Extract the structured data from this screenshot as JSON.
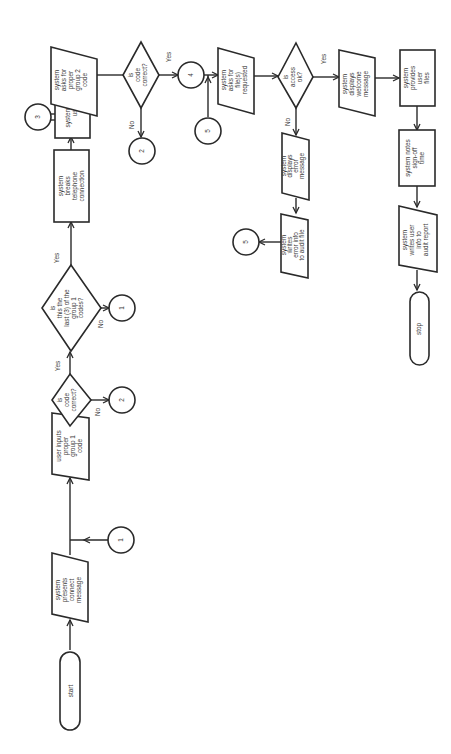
{
  "diagram": {
    "orientation": "rotated 90 degrees (text reads bottom-to-top)",
    "nodes": {
      "start": {
        "type": "terminal",
        "lines": [
          "start"
        ]
      },
      "connect_msg": {
        "type": "io",
        "lines": [
          "system",
          "presents",
          "connect",
          "message"
        ]
      },
      "conn1_a": {
        "type": "connector",
        "label": "1"
      },
      "input_g1": {
        "type": "io",
        "lines": [
          "user inputs",
          "proper",
          "group 1",
          "code"
        ]
      },
      "dec_code1": {
        "type": "decision",
        "lines": [
          "is",
          "code",
          "correct?"
        ],
        "yes": "Yes",
        "no": "No"
      },
      "conn2_a": {
        "type": "connector",
        "label": "2"
      },
      "dec_last": {
        "type": "decision",
        "lines": [
          "is",
          "this the",
          "last (3) of the",
          "group 1",
          "codes?"
        ],
        "yes": "Yes",
        "no": "No"
      },
      "conn1_b": {
        "type": "connector",
        "label": "1"
      },
      "break_conn": {
        "type": "process",
        "lines": [
          "system",
          "breaks",
          "telephone",
          "connection"
        ]
      },
      "calls_user": {
        "type": "process",
        "lines": [
          "system calls",
          "user"
        ]
      },
      "conn3": {
        "type": "connector",
        "label": "3"
      },
      "ask_g2": {
        "type": "io",
        "lines": [
          "system",
          "asks for",
          "proper",
          "group 2",
          "code"
        ]
      },
      "dec_code2": {
        "type": "decision",
        "lines": [
          "is",
          "code",
          "correct?"
        ],
        "yes": "Yes",
        "no": "No"
      },
      "conn2_b": {
        "type": "connector",
        "label": "2"
      },
      "conn4": {
        "type": "connector",
        "label": "4"
      },
      "conn5_a": {
        "type": "connector",
        "label": "5"
      },
      "ask_files": {
        "type": "io",
        "lines": [
          "system",
          "asks for",
          "file(s)",
          "requested"
        ]
      },
      "dec_access": {
        "type": "decision",
        "lines": [
          "is",
          "access",
          "ok?"
        ],
        "yes": "Yes",
        "no": "No"
      },
      "err_msg": {
        "type": "io",
        "lines": [
          "system",
          "displays",
          "error",
          "message"
        ]
      },
      "err_audit": {
        "type": "io",
        "lines": [
          "system",
          "writes",
          "error info",
          "to audit file"
        ]
      },
      "conn5_b": {
        "type": "connector",
        "label": "5"
      },
      "welcome": {
        "type": "io",
        "lines": [
          "system",
          "displays",
          "welcome",
          "message"
        ]
      },
      "provide_files": {
        "type": "process",
        "lines": [
          "system",
          "provides",
          "user",
          "files"
        ]
      },
      "signoff": {
        "type": "process",
        "lines": [
          "system notes",
          "sign-off",
          "time"
        ]
      },
      "user_audit": {
        "type": "io",
        "lines": [
          "system",
          "writes user",
          "info to",
          "audit report"
        ]
      },
      "stop": {
        "type": "terminal",
        "lines": [
          "stop"
        ]
      }
    }
  }
}
